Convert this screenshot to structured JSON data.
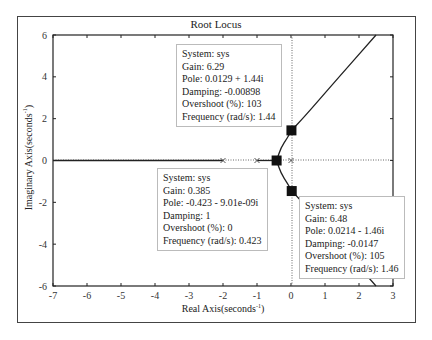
{
  "chart_data": {
    "type": "line",
    "title": "Root Locus",
    "xlabel": "Real Axis(seconds⁻¹)",
    "ylabel": "Imaginary Axis(seconds⁻¹)",
    "xlabel_main": "Real Axis(seconds",
    "ylabel_main": "Imaginary Axis(seconds",
    "unit_sup": "-1",
    "xlim": [
      -7,
      3
    ],
    "ylim": [
      -6,
      6
    ],
    "xticks": [
      "-7",
      "-6",
      "-5",
      "-4",
      "-3",
      "-2",
      "-1",
      "0",
      "1",
      "2",
      "3"
    ],
    "yticks": [
      "6",
      "4",
      "2",
      "0",
      "-2",
      "-4",
      "-6"
    ],
    "grid": false,
    "open_loop_poles": [
      [
        -2,
        0
      ],
      [
        -1,
        0
      ],
      [
        0,
        0
      ]
    ],
    "branches": [
      {
        "name": "real axis branch",
        "points": [
          [
            -7,
            0
          ],
          [
            -2,
            0
          ]
        ]
      },
      {
        "name": "breakaway segment",
        "points": [
          [
            -1,
            0
          ],
          [
            -0.423,
            0
          ]
        ]
      },
      {
        "name": "upper branch",
        "points": [
          [
            -0.423,
            0
          ],
          [
            -0.3,
            0.6
          ],
          [
            -0.1,
            1.1
          ],
          [
            0.0129,
            1.44
          ],
          [
            0.4,
            2.1
          ],
          [
            1.2,
            3.6
          ],
          [
            2.5,
            6
          ]
        ]
      },
      {
        "name": "lower branch",
        "points": [
          [
            -0.423,
            0
          ],
          [
            -0.3,
            -0.6
          ],
          [
            -0.1,
            -1.1
          ],
          [
            0.0214,
            -1.46
          ],
          [
            0.4,
            -2.1
          ],
          [
            1.2,
            -3.6
          ],
          [
            2.5,
            -6
          ]
        ]
      }
    ],
    "data_tips": [
      {
        "system": "System: sys",
        "gain": "Gain: 6.29",
        "pole": "Pole: 0.0129 + 1.44i",
        "damping": "Damping: -0.00898",
        "overshoot": "Overshoot (%): 103",
        "frequency": "Frequency (rad/s): 1.44",
        "x": 0.0129,
        "y": 1.44
      },
      {
        "system": "System: sys",
        "gain": "Gain: 0.385",
        "pole": "Pole: -0.423 - 9.01e-09i",
        "damping": "Damping: 1",
        "overshoot": "Overshoot (%): 0",
        "frequency": "Frequency (rad/s): 0.423",
        "x": -0.423,
        "y": 0
      },
      {
        "system": "System: sys",
        "gain": "Gain: 6.48",
        "pole": "Pole: 0.0214 - 1.46i",
        "damping": "Damping: -0.0147",
        "overshoot": "Overshoot (%): 105",
        "frequency": "Frequency (rad/s): 1.46",
        "x": 0.0214,
        "y": -1.46
      }
    ]
  }
}
